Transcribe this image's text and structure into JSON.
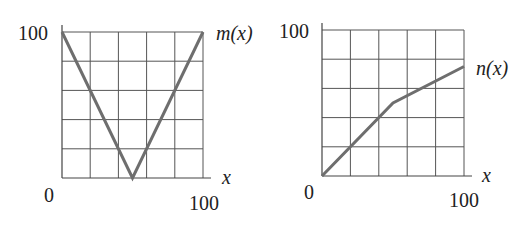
{
  "chart_data": [
    {
      "type": "line",
      "title": "",
      "series": [
        {
          "name": "m(x)",
          "x": [
            0,
            50,
            100
          ],
          "y": [
            100,
            0,
            100
          ]
        }
      ],
      "xlabel": "x",
      "ylabel": "",
      "series_label": "m(x)",
      "xlim": [
        0,
        100
      ],
      "ylim": [
        0,
        100
      ],
      "x_tick_labels": [
        "0",
        "100"
      ],
      "y_tick_labels": [
        "100"
      ],
      "grid": true,
      "grid_divisions": 5
    },
    {
      "type": "line",
      "title": "",
      "series": [
        {
          "name": "n(x)",
          "x": [
            0,
            50,
            100
          ],
          "y": [
            0,
            50,
            75
          ]
        }
      ],
      "xlabel": "x",
      "ylabel": "",
      "series_label": "n(x)",
      "xlim": [
        0,
        100
      ],
      "ylim": [
        0,
        100
      ],
      "x_tick_labels": [
        "0",
        "100"
      ],
      "y_tick_labels": [
        "100"
      ],
      "grid": true,
      "grid_divisions": 5
    }
  ]
}
